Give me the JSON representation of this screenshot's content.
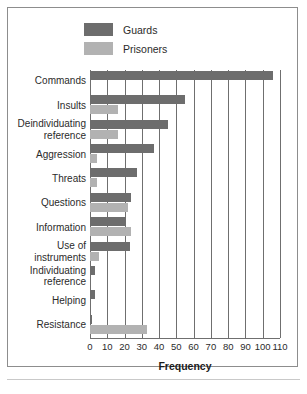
{
  "chart_data": {
    "type": "bar",
    "orientation": "horizontal",
    "title": "",
    "xlabel": "Frequency",
    "ylabel": "",
    "xlim": [
      0,
      110
    ],
    "xticks": [
      0,
      10,
      20,
      30,
      40,
      50,
      60,
      70,
      80,
      90,
      100,
      110
    ],
    "grid": true,
    "legend_position": "top-left",
    "categories": [
      "Commands",
      "Insults",
      "Deindividuating reference",
      "Aggression",
      "Threats",
      "Questions",
      "Information",
      "Use of instruments",
      "Individuating reference",
      "Helping",
      "Resistance"
    ],
    "category_lines": [
      [
        "Commands"
      ],
      [
        "Insults"
      ],
      [
        "Deindividuating",
        "reference"
      ],
      [
        "Aggression"
      ],
      [
        "Threats"
      ],
      [
        "Questions"
      ],
      [
        "Information"
      ],
      [
        "Use of",
        "instruments"
      ],
      [
        "Individuating",
        "reference"
      ],
      [
        "Helping"
      ],
      [
        "Resistance"
      ]
    ],
    "series": [
      {
        "name": "Guards",
        "color": "#6d6d6d",
        "values": [
          106,
          55,
          45,
          37,
          27,
          24,
          21,
          23,
          3,
          3,
          1
        ]
      },
      {
        "name": "Prisoners",
        "color": "#b2b2b2",
        "values": [
          0,
          16,
          16,
          4,
          4,
          22,
          24,
          5,
          0,
          0,
          33
        ]
      }
    ]
  },
  "legend": {
    "items": [
      {
        "label": "Guards",
        "color": "#6d6d6d"
      },
      {
        "label": "Prisoners",
        "color": "#b2b2b2"
      }
    ]
  },
  "axis": {
    "xlabel": "Frequency"
  }
}
